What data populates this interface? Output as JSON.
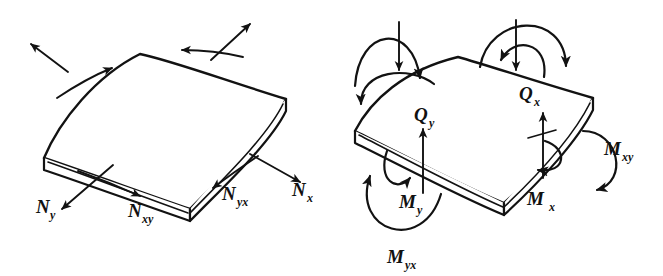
{
  "figure": {
    "background_color": "#ffffff",
    "ink_color": "#121212",
    "panels": [
      {
        "id": "membrane-forces",
        "name": "left-panel",
        "description": "Curved shell element with in-plane membrane force resultants",
        "labels": [
          {
            "id": "n-y",
            "base": "N",
            "subscript": "y",
            "text": "N_y",
            "x": 36,
            "y": 213,
            "meaning": "normal membrane force in y direction"
          },
          {
            "id": "n-xy",
            "base": "N",
            "subscript": "xy",
            "text": "N_xy",
            "x": 128,
            "y": 217,
            "meaning": "in-plane shear force on x face acting in y direction"
          },
          {
            "id": "n-yx",
            "base": "N",
            "subscript": "yx",
            "text": "N_yx",
            "x": 222,
            "y": 200,
            "meaning": "in-plane shear force on y face acting in x direction"
          },
          {
            "id": "n-x",
            "base": "N",
            "subscript": "x",
            "text": "N_x",
            "x": 292,
            "y": 196,
            "meaning": "normal membrane force in x direction"
          }
        ]
      },
      {
        "id": "moments-shears",
        "name": "right-panel",
        "description": "Curved shell element with bending moments, twisting moments and transverse shear resultants",
        "labels": [
          {
            "id": "q-y",
            "base": "Q",
            "subscript": "y",
            "text": "Q_y",
            "x": 414,
            "y": 121,
            "meaning": "transverse shear force on y face"
          },
          {
            "id": "q-x",
            "base": "Q",
            "subscript": "x",
            "text": "Q_x",
            "x": 519,
            "y": 100,
            "meaning": "transverse shear force on x face"
          },
          {
            "id": "m-xy",
            "base": "M",
            "subscript": "xy",
            "text": "M_xy",
            "x": 604,
            "y": 155,
            "meaning": "twisting moment on x face about y axis"
          },
          {
            "id": "m-y",
            "base": "M",
            "subscript": "y",
            "text": "M_y",
            "x": 399,
            "y": 208,
            "meaning": "bending moment about y direction"
          },
          {
            "id": "m-x",
            "base": "M",
            "subscript": "x",
            "text": "M_x",
            "x": 527,
            "y": 205,
            "meaning": "bending moment about x direction"
          },
          {
            "id": "m-yx",
            "base": "M",
            "subscript": "yx",
            "text": "M_yx",
            "x": 387,
            "y": 263,
            "meaning": "twisting moment on y face about x axis"
          }
        ]
      }
    ]
  }
}
